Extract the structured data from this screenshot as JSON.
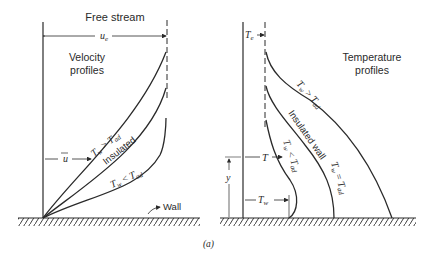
{
  "figure": {
    "caption": "(a)",
    "velocity_panel": {
      "title_top": "Free stream",
      "label_line1": "Velocity",
      "label_line2": "profiles",
      "edge_velocity": "u",
      "edge_velocity_sub": "e",
      "local_velocity": "u",
      "wall_label": "Wall",
      "curves": [
        {
          "label": "T",
          "sub": "w",
          "rel": " > ",
          "ref": "T",
          "ref_sub": "ad"
        },
        {
          "label": "Insulated"
        },
        {
          "label": "T",
          "sub": "w",
          "rel": " < ",
          "ref": "T",
          "ref_sub": "ad"
        }
      ]
    },
    "temperature_panel": {
      "label_line1": "Temperature",
      "label_line2": "profiles",
      "edge_temp": "T",
      "edge_temp_sub": "e",
      "local_temp": "T",
      "wall_temp": "T",
      "wall_temp_sub": "w",
      "height": "y",
      "curves": [
        {
          "label": "T",
          "sub": "w",
          "rel": " > ",
          "ref": "T",
          "ref_sub": "ad"
        },
        {
          "label": "Insulated wall"
        },
        {
          "label": "T",
          "sub": "w",
          "rel": " = ",
          "ref": "T",
          "ref_sub": "ad"
        },
        {
          "label": "T",
          "sub": "w",
          "rel": " < ",
          "ref": "T",
          "ref_sub": "ad"
        }
      ]
    }
  }
}
